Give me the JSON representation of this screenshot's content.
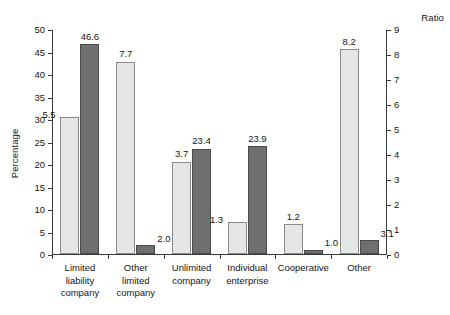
{
  "chart_data": {
    "type": "bar",
    "title": "",
    "subtitle": "",
    "xlabel": "",
    "ylabel": "Percentage",
    "y2label": "Ratio",
    "ylim": [
      0,
      50
    ],
    "y2lim": [
      0,
      9
    ],
    "yticks": [
      0,
      5,
      10,
      15,
      20,
      25,
      30,
      35,
      40,
      45,
      50
    ],
    "y2ticks": [
      0,
      1,
      2,
      3,
      4,
      5,
      6,
      7,
      8,
      9
    ],
    "grid": false,
    "legend": "none",
    "categories": [
      "Limited\nliability\ncompany",
      "Other\nlimited\ncompany",
      "Unlimited\ncompany",
      "Individual\nenterprise",
      "Cooperative",
      "Other"
    ],
    "series": [
      {
        "name": "Ratio",
        "axis": "right",
        "color": "#e6e6e6",
        "values": [
          5.5,
          7.7,
          3.7,
          1.3,
          1.2,
          8.2
        ],
        "labels": [
          "5.5",
          "7.7",
          "3.7",
          "1.3",
          "1.2",
          "8.2"
        ]
      },
      {
        "name": "Percentage",
        "axis": "left",
        "color": "#6f6f6f",
        "values": [
          46.6,
          2.0,
          23.4,
          23.9,
          1.0,
          3.1
        ],
        "labels": [
          "46.6",
          "2.0",
          "23.4",
          "23.9",
          "1.0",
          "3.1"
        ]
      }
    ]
  },
  "axes": {
    "left": {
      "title": "Percentage",
      "ticks": [
        "0",
        "5",
        "10",
        "15",
        "20",
        "25",
        "30",
        "35",
        "40",
        "45",
        "50"
      ]
    },
    "right": {
      "title": "Ratio",
      "ticks": [
        "0",
        "1",
        "2",
        "3",
        "4",
        "5",
        "6",
        "7",
        "8",
        "9"
      ]
    }
  }
}
